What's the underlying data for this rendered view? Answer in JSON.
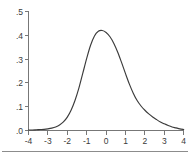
{
  "figure": {
    "name": "density-plot",
    "background_color": "#ffffff",
    "axis_color": "#777777",
    "curve_color": "#3b3b3b",
    "label_color": "#3a3a3a",
    "footer_rule_color": "#8c8c8c"
  },
  "chart_data": {
    "type": "line",
    "title": "",
    "subtitle": "",
    "xlabel": "",
    "ylabel": "",
    "xlim": [
      -4,
      4
    ],
    "ylim": [
      0,
      0.5
    ],
    "grid": false,
    "legend": null,
    "legend_position": "none",
    "x_tick_labels": [
      "-4",
      "-3",
      "-2",
      "-1",
      "0",
      "1",
      "2",
      "3",
      "4"
    ],
    "x_ticks": [
      -4,
      -3,
      -2,
      -1,
      0,
      1,
      2,
      3,
      4
    ],
    "y_tick_labels": [
      ".0",
      ".1",
      ".2",
      ".3",
      ".4",
      ".5"
    ],
    "y_ticks": [
      0.0,
      0.1,
      0.2,
      0.3,
      0.4,
      0.5
    ],
    "annotations": [],
    "series": [
      {
        "name": "density",
        "x": [
          -4.0,
          -3.8,
          -3.6,
          -3.4,
          -3.2,
          -3.0,
          -2.8,
          -2.6,
          -2.4,
          -2.2,
          -2.0,
          -1.8,
          -1.6,
          -1.4,
          -1.2,
          -1.0,
          -0.8,
          -0.6,
          -0.4,
          -0.2,
          0.0,
          0.2,
          0.4,
          0.6,
          0.8,
          1.0,
          1.2,
          1.4,
          1.6,
          1.8,
          2.0,
          2.2,
          2.4,
          2.6,
          2.8,
          3.0,
          3.2,
          3.4,
          3.6,
          3.8,
          4.0
        ],
        "y": [
          0.002,
          0.002,
          0.003,
          0.004,
          0.005,
          0.007,
          0.01,
          0.015,
          0.023,
          0.036,
          0.056,
          0.086,
          0.127,
          0.179,
          0.241,
          0.303,
          0.358,
          0.397,
          0.417,
          0.42,
          0.412,
          0.394,
          0.366,
          0.329,
          0.285,
          0.239,
          0.195,
          0.157,
          0.126,
          0.103,
          0.085,
          0.07,
          0.057,
          0.046,
          0.036,
          0.028,
          0.021,
          0.015,
          0.011,
          0.007,
          0.004
        ],
        "peak_x": -0.15,
        "peak_y": 0.42
      }
    ]
  }
}
